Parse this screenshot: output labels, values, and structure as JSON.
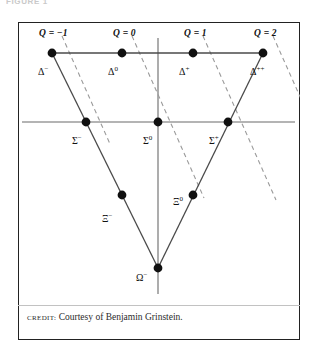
{
  "running_head": "FIGURE 1",
  "figure": {
    "frame": {
      "x": 18,
      "y": 22,
      "width": 282,
      "height": 318
    }
  },
  "credit": {
    "label": "CREDIT:",
    "text": " Courtesy of Benjamin Grinstein."
  },
  "chart_data": {
    "type": "scatter",
    "title": "",
    "subtitle": "",
    "xlabel": "",
    "ylabel": "",
    "grid": false,
    "legend_position": "none",
    "axes": {
      "horizontal": {
        "x1": 4,
        "y1": 100,
        "x2": 277,
        "y2": 100
      },
      "vertical": {
        "x1": 140,
        "y1": 16,
        "x2": 140,
        "y2": 272
      }
    },
    "rows": [
      {
        "name": "Delta row",
        "y": 31,
        "count": 4
      },
      {
        "name": "Sigma row",
        "y": 100,
        "count": 3
      },
      {
        "name": "Xi row",
        "y": 173,
        "count": 2
      },
      {
        "name": "Omega row",
        "y": 246,
        "count": 1
      }
    ],
    "points": [
      {
        "id": "delta-minus",
        "label": "Δ",
        "charge_sup": "−",
        "x": 34,
        "y": 31,
        "label_x": 20,
        "label_y": 44,
        "Q": -1
      },
      {
        "id": "delta-zero",
        "label": "Δ",
        "charge_sup": "0",
        "x": 104,
        "y": 31,
        "label_x": 90,
        "label_y": 44,
        "Q": 0
      },
      {
        "id": "delta-plus",
        "label": "Δ",
        "charge_sup": "+",
        "x": 175,
        "y": 31,
        "label_x": 161,
        "label_y": 44,
        "Q": 1
      },
      {
        "id": "delta-plus-plus",
        "label": "Δ",
        "charge_sup": "++",
        "x": 245,
        "y": 31,
        "label_x": 232,
        "label_y": 44,
        "Q": 2
      },
      {
        "id": "sigma-minus",
        "label": "Σ",
        "charge_sup": "−",
        "x": 68,
        "y": 100,
        "label_x": 54,
        "label_y": 113,
        "Q": -1
      },
      {
        "id": "sigma-zero",
        "label": "Σ",
        "charge_sup": "0",
        "x": 140,
        "y": 100,
        "label_x": 125,
        "label_y": 113,
        "Q": 0
      },
      {
        "id": "sigma-plus",
        "label": "Σ",
        "charge_sup": "+",
        "x": 210,
        "y": 100,
        "label_x": 191,
        "label_y": 113,
        "Q": 1
      },
      {
        "id": "xi-minus",
        "label": "Ξ",
        "charge_sup": "−",
        "x": 104,
        "y": 173,
        "label_x": 84,
        "label_y": 191,
        "Q": -1
      },
      {
        "id": "xi-zero",
        "label": "Ξ",
        "charge_sup": "0",
        "x": 175,
        "y": 173,
        "label_x": 155,
        "label_y": 174,
        "Q": 0
      },
      {
        "id": "omega-minus",
        "label": "Ω",
        "charge_sup": "−",
        "x": 140,
        "y": 246,
        "label_x": 118,
        "label_y": 250,
        "Q": -1
      }
    ],
    "charge_lines": [
      {
        "label": "Q = −1",
        "label_x": 21,
        "label_y": 6,
        "x1": 44,
        "y1": 14,
        "x2": 92,
        "y2": 122
      },
      {
        "label": "Q = 0",
        "label_x": 95,
        "label_y": 6,
        "x1": 114,
        "y1": 14,
        "x2": 186,
        "y2": 176
      },
      {
        "label": "Q = 1",
        "label_x": 166,
        "label_y": 6,
        "x1": 185,
        "y1": 14,
        "x2": 258,
        "y2": 178
      },
      {
        "label": "Q = 2",
        "label_x": 236,
        "label_y": 6,
        "x1": 255,
        "y1": 14,
        "x2": 296,
        "y2": 106
      }
    ],
    "triangle": {
      "vertices": [
        {
          "x": 34,
          "y": 31
        },
        {
          "x": 245,
          "y": 31
        },
        {
          "x": 140,
          "y": 246
        }
      ]
    },
    "colors": {
      "point": "#101010",
      "solid_line": "#4a4a4a",
      "dashed_line": "#9a9a9a",
      "axis": "#6a6a6a",
      "frame": "#222222",
      "text": "#111111"
    }
  }
}
